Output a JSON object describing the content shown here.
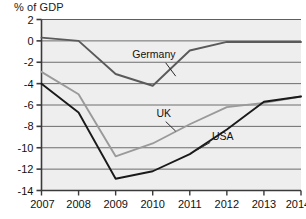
{
  "chart_data": {
    "type": "line",
    "title": "% of GDP",
    "xlabel": "",
    "ylabel": "% of GDP",
    "x": [
      2007,
      2008,
      2009,
      2010,
      2011,
      2012,
      2013,
      2014
    ],
    "categories": [
      "2007",
      "2008",
      "2009",
      "2010",
      "2011",
      "2012",
      "2013",
      "2014"
    ],
    "ylim": [
      -14,
      2
    ],
    "yticks": [
      2,
      0,
      -2,
      -4,
      -6,
      -8,
      -10,
      -12,
      -14
    ],
    "ytick_labels": [
      "2",
      "0",
      "-2",
      "-4",
      "-6",
      "-8",
      "-10",
      "-12",
      "-14"
    ],
    "grid": true,
    "grid_axis": "y",
    "legend": "inline-annotations",
    "series": [
      {
        "name": "Germany",
        "color": "#5a5a5a",
        "values": [
          0.3,
          0.0,
          -3.1,
          -4.2,
          -0.9,
          -0.1,
          -0.1,
          -0.1
        ],
        "label_x": 2009.45,
        "label_y": -1.6
      },
      {
        "name": "UK",
        "color": "#9a9a9a",
        "values": [
          -2.9,
          -5.0,
          -10.8,
          -9.6,
          -7.8,
          -6.2,
          -5.8,
          -5.2
        ],
        "label_x": 2010.1,
        "label_y": -7.1
      },
      {
        "name": "USA",
        "color": "#1a1a1a",
        "values": [
          -4.0,
          -6.7,
          -12.9,
          -12.2,
          -10.6,
          -8.3,
          -5.7,
          -5.2
        ],
        "label_x": 2011.6,
        "label_y": -9.3
      }
    ],
    "annotations": [
      {
        "text": "Germany",
        "leader_from": [
          2010.35,
          -2.05
        ],
        "leader_to": [
          2010.62,
          -3.3
        ]
      },
      {
        "text": "UK",
        "leader_from": [
          2010.35,
          -7.55
        ],
        "leader_to": [
          2010.62,
          -8.45
        ]
      },
      {
        "text": "USA",
        "leader_from": [
          2011.55,
          -9.5
        ],
        "leader_to": [
          2011.2,
          -10.2
        ]
      }
    ]
  }
}
